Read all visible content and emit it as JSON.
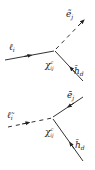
{
  "diagrams": [
    {
      "name": "top-vertex",
      "vertex_label": "χ",
      "vertex_sup": "c",
      "vertex_sub": "ij",
      "incoming": {
        "label": "ℓ",
        "sub": "i",
        "style": "solid"
      },
      "outgoing_up": {
        "label": "ẽ",
        "sub": "j",
        "style": "dashed"
      },
      "outgoing_down": {
        "label": "h̄",
        "sub": "d",
        "style": "solid"
      }
    },
    {
      "name": "bottom-vertex",
      "vertex_label": "χ",
      "vertex_sup": "c",
      "vertex_sub": "ij",
      "incoming": {
        "label": "ℓ̃",
        "sub": "i",
        "style": "dashed"
      },
      "outgoing_up": {
        "label": "ē",
        "sub": "j",
        "style": "solid"
      },
      "outgoing_down": {
        "label": "h̄",
        "sub": "d",
        "style": "solid"
      }
    }
  ],
  "colors": {
    "line": "#333333",
    "text": "#222222"
  }
}
